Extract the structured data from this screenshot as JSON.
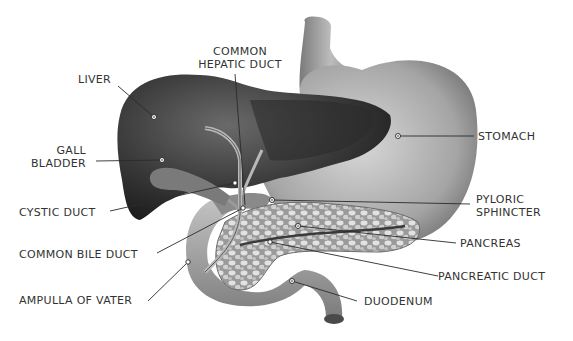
{
  "diagram": {
    "type": "anatomical-illustration",
    "colors": {
      "background": "#ffffff",
      "label_text": "#333333",
      "leader_line": "#2a2a2a",
      "liver": "#3a3a3a",
      "stomach": "#b5b5b5",
      "pancreas": "#c8c8c8",
      "duodenum": "#a8a8a8"
    },
    "labels": {
      "common_hepatic_duct": {
        "line1": "COMMON",
        "line2": "HEPATIC DUCT"
      },
      "liver": "LIVER",
      "gall_bladder": {
        "line1": "GALL",
        "line2": "BLADDER"
      },
      "cystic_duct": "CYSTIC DUCT",
      "common_bile_duct": "COMMON BILE DUCT",
      "ampulla_of_vater": "AMPULLA OF VATER",
      "stomach": "STOMACH",
      "pyloric_sphincter": {
        "line1": "PYLORIC",
        "line2": "SPHINCTER"
      },
      "pancreas": "PANCREAS",
      "pancreatic_duct": "PANCREATIC DUCT",
      "duodenum": "DUODENUM"
    }
  }
}
